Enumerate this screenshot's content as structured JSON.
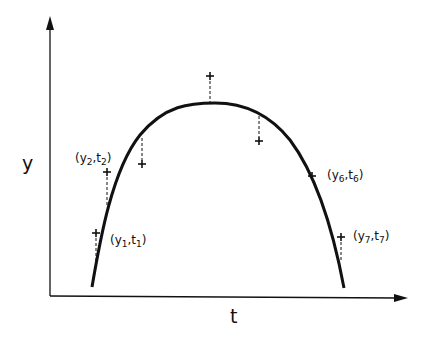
{
  "diagram": {
    "axis_labels": {
      "x": "t",
      "y": "y"
    },
    "points": [
      {
        "id": 1,
        "label_y": "y",
        "label_t": "t",
        "sub": "1",
        "x": 96,
        "y": 233,
        "curve_y": 260
      },
      {
        "id": 2,
        "label_y": "y",
        "label_t": "t",
        "sub": "2",
        "x": 107,
        "y": 172,
        "curve_y": 205
      },
      {
        "id": 3,
        "x": 142,
        "y": 164,
        "curve_y": 138
      },
      {
        "id": 4,
        "x": 210,
        "y": 76,
        "curve_y": 103
      },
      {
        "id": 5,
        "x": 259,
        "y": 141,
        "curve_y": 116
      },
      {
        "id": 6,
        "label_y": "y",
        "label_t": "t",
        "sub": "6",
        "x": 312,
        "y": 176
      },
      {
        "id": 7,
        "label_y": "y",
        "label_t": "t",
        "sub": "7",
        "x": 341,
        "y": 237,
        "curve_y": 262
      }
    ],
    "colors": {
      "ink": "#111111",
      "background": "#ffffff"
    }
  }
}
